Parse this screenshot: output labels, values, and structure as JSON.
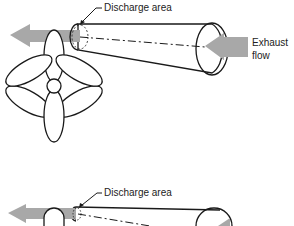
{
  "diagram": {
    "top": {
      "discharge_label": "Discharge area",
      "exhaust_label_line1": "Exhaust",
      "exhaust_label_line2": "flow"
    },
    "bottom": {
      "discharge_label": "Discharge area"
    },
    "colors": {
      "arrow_fill": "#a8a8a8",
      "line": "#1a1a1a",
      "background": "#ffffff"
    }
  }
}
